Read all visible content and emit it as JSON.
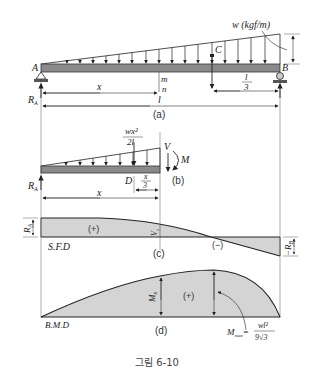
{
  "figure": {
    "caption": "그림 6-10",
    "panel_a": {
      "label": "(a)",
      "load_label": "w (kgf/m)",
      "point_A": "A",
      "point_B": "B",
      "point_C": "C",
      "section_m": "m",
      "section_n": "n",
      "dim_x": "x",
      "dim_l": "l",
      "dim_l_num": "l",
      "dim_l_den": "3",
      "reaction_A": "R",
      "reaction_A_sub": "A"
    },
    "panel_b": {
      "label": "(b)",
      "force_num": "wx²",
      "force_den": "2l",
      "shear_V": "V",
      "moment_M": "M",
      "point_D": "D",
      "dim_x3_num": "x",
      "dim_x3_den": "3",
      "dim_x": "x",
      "reaction_A": "R",
      "reaction_A_sub": "A"
    },
    "panel_c": {
      "label": "(c)",
      "title": "S.F.D",
      "positive": "(+)",
      "negative": "(−)",
      "RA": "R",
      "RA_sub": "A",
      "Vx": "V",
      "Vx_sub": "x",
      "RB": "−R",
      "RB_sub": "B"
    },
    "panel_d": {
      "label": "(d)",
      "title": "B.M.D",
      "positive": "(+)",
      "Mx": "M",
      "Mx_sub": "x",
      "Mmax": "M",
      "Mmax_sub": "max",
      "Mmax_eq": "=",
      "Mmax_num": "wl²",
      "Mmax_den": "9√3"
    }
  }
}
